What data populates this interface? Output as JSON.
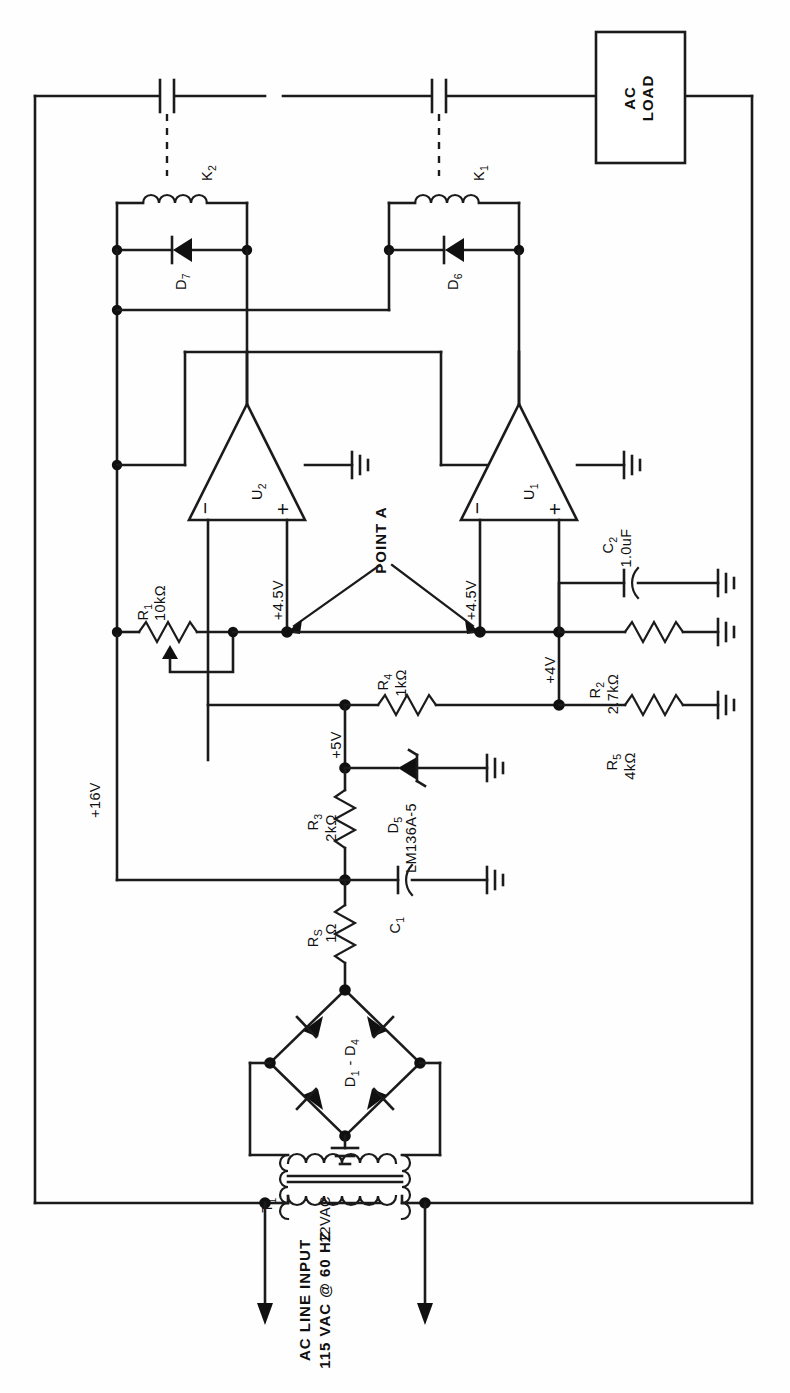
{
  "orientation": "rotated-90-ccw",
  "blocks": {
    "ac_load": {
      "line1": "AC",
      "line2": "LOAD"
    }
  },
  "labels": {
    "point_a": "POINT A",
    "ac_line_input_1": "AC LINE INPUT",
    "ac_line_input_2": "115 VAC @ 60 HZ",
    "transformer_secondary": "12VAC"
  },
  "nets": {
    "v16": "+16V",
    "v5": "+5V",
    "v4_5_u2": "+4.5V",
    "v4_5_u1": "+4.5V",
    "v4": "+4V"
  },
  "components": [
    {
      "ref": "T",
      "sub": "1",
      "value": "",
      "type": "transformer"
    },
    {
      "ref": "D",
      "sub": "1",
      "value": "",
      "type": "bridge",
      "span": "D₁ - D₄"
    },
    {
      "ref": "R",
      "sub": "S",
      "value": "1Ω",
      "type": "resistor"
    },
    {
      "ref": "C",
      "sub": "1",
      "value": "",
      "type": "capacitor-polarized"
    },
    {
      "ref": "R",
      "sub": "3",
      "value": "2kΩ",
      "type": "resistor"
    },
    {
      "ref": "D",
      "sub": "5",
      "value": "LM136A-5",
      "type": "zener"
    },
    {
      "ref": "R",
      "sub": "4",
      "value": "1kΩ",
      "type": "resistor"
    },
    {
      "ref": "R",
      "sub": "1",
      "value": "10kΩ",
      "type": "potentiometer"
    },
    {
      "ref": "R",
      "sub": "2",
      "value": "2.7kΩ",
      "type": "resistor"
    },
    {
      "ref": "R",
      "sub": "5",
      "value": "4kΩ",
      "type": "resistor"
    },
    {
      "ref": "C",
      "sub": "2",
      "value": "1.0uF",
      "type": "capacitor"
    },
    {
      "ref": "U",
      "sub": "1",
      "value": "",
      "type": "opamp"
    },
    {
      "ref": "U",
      "sub": "2",
      "value": "",
      "type": "opamp"
    },
    {
      "ref": "D",
      "sub": "6",
      "value": "",
      "type": "diode"
    },
    {
      "ref": "D",
      "sub": "7",
      "value": "",
      "type": "diode"
    },
    {
      "ref": "K",
      "sub": "1",
      "value": "",
      "type": "relay-coil"
    },
    {
      "ref": "K",
      "sub": "2",
      "value": "",
      "type": "relay-coil"
    }
  ],
  "refdes": {
    "T1_base": "T",
    "T1_sub": "1",
    "D1D4_base": "D",
    "D1D4_sub": "1",
    "D1D4_tail": " - D",
    "D1D4_tail_sub": "4",
    "RS_base": "R",
    "RS_sub": "S",
    "RS_val": "1Ω",
    "C1_base": "C",
    "C1_sub": "1",
    "R3_base": "R",
    "R3_sub": "3",
    "R3_val": "2kΩ",
    "D5_base": "D",
    "D5_sub": "5",
    "D5_val": "LM136A-5",
    "R4_base": "R",
    "R4_sub": "4",
    "R4_val": "1kΩ",
    "R1_base": "R",
    "R1_sub": "1",
    "R1_val": "10kΩ",
    "R2_base": "R",
    "R2_sub": "2",
    "R2_val": "2.7kΩ",
    "R5_base": "R",
    "R5_sub": "5",
    "R5_val": "4kΩ",
    "C2_base": "C",
    "C2_sub": "2",
    "C2_val": "1.0uF",
    "U1_base": "U",
    "U1_sub": "1",
    "U2_base": "U",
    "U2_sub": "2",
    "D6_base": "D",
    "D6_sub": "6",
    "D7_base": "D",
    "D7_sub": "7",
    "K1_base": "K",
    "K1_sub": "1",
    "K2_base": "K",
    "K2_sub": "2"
  },
  "opamp_pins": {
    "minus": "−",
    "plus": "+"
  },
  "colors": {
    "ink": "#101010",
    "background": "#fefefe",
    "wire": "#1b1b1b"
  }
}
